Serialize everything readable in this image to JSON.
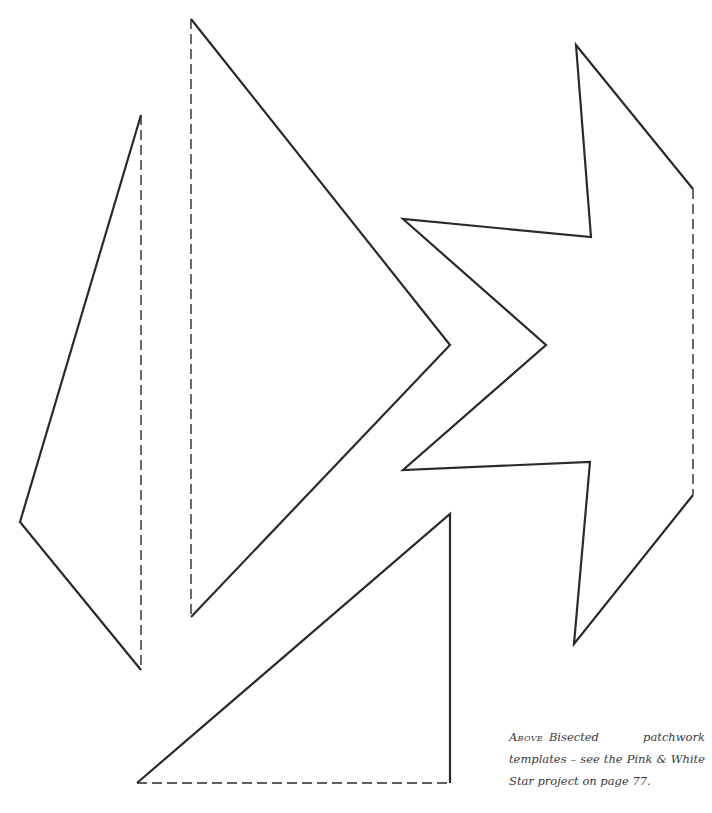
{
  "caption": {
    "lead": "Above",
    "text": "Bisected patchwork templates – see the Pink & White Star project on page 77."
  },
  "colors": {
    "stroke": "#2a2a2a",
    "background": "#ffffff",
    "caption_text": "#3a3a3a"
  },
  "templates": [
    {
      "name": "narrow-triangle-left",
      "solid": "141,115 20,522 141,670",
      "dashed": "141,115 141,670"
    },
    {
      "name": "large-triangle-center",
      "solid": "191,19 450,345 191,617",
      "dashed": "191,19 191,617"
    },
    {
      "name": "star-half-right",
      "solid": "693,642 574,864 403,470 590,460 546,345 403,219 591,238 576,45 693,189",
      "dashed": "693,189 693,495"
    },
    {
      "name": "right-triangle-bottom",
      "solid": "137,783 450,514 450,783",
      "dashed": "137,783 450,783"
    }
  ]
}
